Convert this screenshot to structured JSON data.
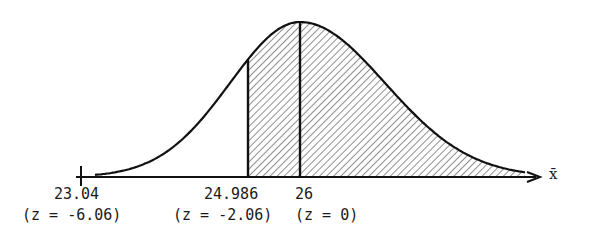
{
  "figure": {
    "axis_symbol": "x̄",
    "labels": [
      {
        "value": "23.04",
        "z": "(z = -6.06)"
      },
      {
        "value": "24.986",
        "z": "(z = -2.06)"
      },
      {
        "value": "26",
        "z": "(z = 0)"
      }
    ]
  },
  "chart_data": {
    "type": "area",
    "title": "",
    "xlabel": "x̄",
    "ylabel": "",
    "distribution": "normal",
    "mean": 26,
    "z_at_left_tick": -6.06,
    "marked_points": [
      {
        "x": 23.04,
        "z": -6.06
      },
      {
        "x": 24.986,
        "z": -2.06
      },
      {
        "x": 26,
        "z": 0
      }
    ],
    "shaded_region": {
      "from_x": 24.986,
      "to": "+infinity",
      "pattern": "diagonal hatch"
    },
    "vertical_lines_at": [
      24.986,
      26
    ],
    "grid": false,
    "legend": null
  }
}
